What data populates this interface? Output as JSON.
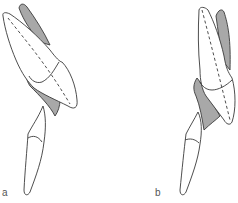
{
  "figure": {
    "panels": [
      {
        "id": "a",
        "label": "a"
      },
      {
        "id": "b",
        "label": "b"
      }
    ],
    "colors": {
      "outline": "#3a3a3a",
      "shade": "#a8a8a8",
      "fill": "#ffffff",
      "label": "#555555"
    }
  }
}
